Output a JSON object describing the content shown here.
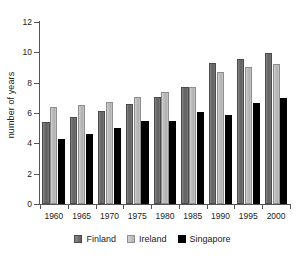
{
  "chart_data": {
    "type": "bar",
    "title": "",
    "subtitle": "",
    "xlabel": "",
    "ylabel": "number of years",
    "categories": [
      "1960",
      "1965",
      "1970",
      "1975",
      "1980",
      "1985",
      "1990",
      "1995",
      "2000"
    ],
    "series": [
      {
        "name": "Finland",
        "color": "#6e6e6e",
        "values": [
          5.4,
          5.75,
          6.1,
          6.6,
          7.05,
          7.7,
          9.3,
          9.55,
          9.95
        ]
      },
      {
        "name": "Ireland",
        "color": "#bdbdbd",
        "values": [
          6.4,
          6.5,
          6.75,
          7.05,
          7.4,
          7.7,
          8.7,
          9.05,
          9.25
        ]
      },
      {
        "name": "Singapore",
        "color": "#000000",
        "values": [
          4.3,
          4.6,
          5.0,
          5.45,
          5.45,
          6.05,
          5.9,
          6.65,
          7.0
        ]
      }
    ],
    "ylim": [
      0,
      12
    ],
    "yticks": [
      0,
      2,
      4,
      6,
      8,
      10,
      12
    ],
    "ytick_labels": [
      "0",
      "2",
      "4",
      "6",
      "8",
      "10",
      "12"
    ],
    "grid": false,
    "legend_position": "bottom",
    "axis_color": "#555555",
    "background_color": "#ffffff"
  },
  "legend": {
    "items": [
      {
        "label": "Finland",
        "swatch": "finland-swatch"
      },
      {
        "label": "Ireland",
        "swatch": "ireland-swatch"
      },
      {
        "label": "Singapore",
        "swatch": "singapore-swatch"
      }
    ]
  }
}
